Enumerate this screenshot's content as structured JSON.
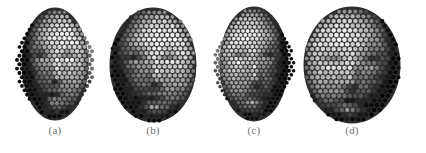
{
  "figure": {
    "background_color": "#ffffff",
    "caption_color": "#6f6f6f",
    "panels": [
      {
        "label": "(a)",
        "view": "frontal-oval-face",
        "shape": "narrow-oval",
        "cx": 55,
        "cy": 64,
        "rx": 33,
        "ry": 56,
        "label_x": 55,
        "label_y": 133,
        "cell_size": 5.0,
        "light_direction": "upper-right",
        "base_gray": "#8a8a8a",
        "features": {
          "eye_left": {
            "x": -13,
            "y": -10,
            "rx": 9,
            "ry": 5
          },
          "eye_right": {
            "x": 13,
            "y": -10,
            "rx": 9,
            "ry": 5
          },
          "nose": {
            "x": 2,
            "y": 10,
            "rx": 7,
            "ry": 11
          },
          "mouth": {
            "x": 0,
            "y": 30,
            "rx": 12,
            "ry": 5
          },
          "chin": {
            "x": 0,
            "y": 44,
            "rx": 14,
            "ry": 8
          }
        }
      },
      {
        "label": "(b)",
        "view": "round-sphere-face",
        "shape": "circle",
        "cx": 153,
        "cy": 65,
        "rx": 43,
        "ry": 57,
        "label_x": 153,
        "label_y": 133,
        "cell_size": 5.2,
        "light_direction": "upper-right",
        "base_gray": "#707070",
        "features": {
          "eye_left": {
            "x": -17,
            "y": -8,
            "rx": 11,
            "ry": 5
          },
          "eye_right": {
            "x": 17,
            "y": -8,
            "rx": 11,
            "ry": 5
          },
          "nose": {
            "x": 3,
            "y": 11,
            "rx": 8,
            "ry": 13
          },
          "mouth": {
            "x": 0,
            "y": 33,
            "rx": 16,
            "ry": 6
          },
          "chin": {
            "x": 0,
            "y": 47,
            "rx": 16,
            "ry": 8
          }
        }
      },
      {
        "label": "(c)",
        "view": "frontal-oval-face-variant",
        "shape": "narrow-oval",
        "cx": 254,
        "cy": 64,
        "rx": 34,
        "ry": 57,
        "label_x": 254,
        "label_y": 133,
        "cell_size": 4.6,
        "light_direction": "upper-left",
        "base_gray": "#858585",
        "features": {
          "eye_left": {
            "x": -14,
            "y": -10,
            "rx": 9,
            "ry": 5
          },
          "eye_right": {
            "x": 14,
            "y": -10,
            "rx": 9,
            "ry": 5
          },
          "nose": {
            "x": 1,
            "y": 12,
            "rx": 7,
            "ry": 12
          },
          "mouth": {
            "x": 0,
            "y": 32,
            "rx": 12,
            "ry": 5
          },
          "chin": {
            "x": 0,
            "y": 45,
            "rx": 14,
            "ry": 9
          }
        }
      },
      {
        "label": "(d)",
        "view": "round-sphere-face-variant",
        "shape": "circle",
        "cx": 352,
        "cy": 65,
        "rx": 48,
        "ry": 58,
        "label_x": 352,
        "label_y": 133,
        "cell_size": 5.4,
        "light_direction": "upper-left",
        "base_gray": "#6a6a6a",
        "features": {
          "eye_left": {
            "x": -20,
            "y": -7,
            "rx": 12,
            "ry": 6
          },
          "eye_right": {
            "x": 19,
            "y": -7,
            "rx": 12,
            "ry": 6
          },
          "nose": {
            "x": -2,
            "y": 13,
            "rx": 9,
            "ry": 14
          },
          "mouth": {
            "x": -3,
            "y": 35,
            "rx": 16,
            "ry": 6
          },
          "chin": {
            "x": -2,
            "y": 49,
            "rx": 16,
            "ry": 8
          }
        }
      }
    ]
  }
}
